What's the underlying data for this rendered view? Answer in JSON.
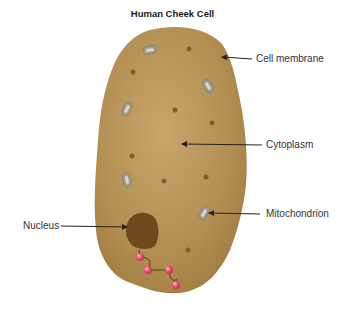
{
  "title": "Human Cheek Cell",
  "labels": {
    "cell_membrane": "Cell membrane",
    "cytoplasm": "Cytoplasm",
    "mitochondrion": "Mitochondrion",
    "nucleus": "Nucleus"
  },
  "colors": {
    "cell_fill": "#b08a4e",
    "cell_highlight": "#c9a56a",
    "nucleus": "#6e4a1e",
    "granule": "#7d6230",
    "mitochondrion": "#9a9a8c",
    "bead": "#f0507a",
    "arrow": "#222222"
  }
}
